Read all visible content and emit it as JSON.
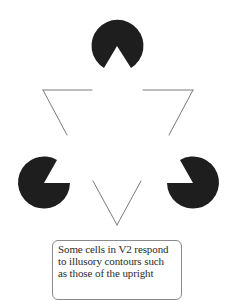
{
  "figure": {
    "type": "kanizsa-triangle-illusion",
    "background_color": "#ffffff",
    "inducer_color": "#1e1e1e",
    "line_color": "#7a7a7a",
    "inducers": [
      {
        "name": "top",
        "cx": 117,
        "cy": 45,
        "r": 26,
        "notch_direction": "down"
      },
      {
        "name": "left",
        "cx": 44,
        "cy": 183,
        "r": 26,
        "notch_direction": "upper-right"
      },
      {
        "name": "right",
        "cx": 193,
        "cy": 183,
        "r": 26,
        "notch_direction": "upper-left"
      }
    ],
    "outline_triangle": {
      "orientation": "inverted",
      "vertices": [
        [
          43,
          90
        ],
        [
          193,
          90
        ],
        [
          117,
          225
        ]
      ]
    }
  },
  "caption": {
    "lines": [
      "Some cells in V2 respond",
      "to illusory contours such",
      "as those of the upright"
    ]
  }
}
